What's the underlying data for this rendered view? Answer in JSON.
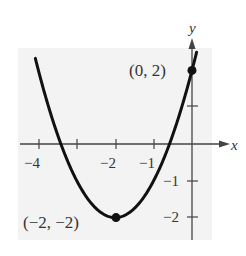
{
  "chart_data": {
    "type": "line",
    "title": "",
    "xlabel": "x",
    "ylabel": "y",
    "function": "y = (x + 2)^2 - 2",
    "xlim": [
      -4.5,
      0.5
    ],
    "ylim": [
      -2.6,
      2.6
    ],
    "x_ticks": [
      -4,
      -3,
      -2,
      -1,
      0
    ],
    "x_tick_labels": [
      "-4",
      "",
      "-2",
      "-1",
      ""
    ],
    "y_ticks": [
      -2,
      -1,
      1,
      2
    ],
    "y_tick_labels": [
      "-2",
      "-1",
      "",
      ""
    ],
    "grid": false,
    "legend": null,
    "series": [
      {
        "name": "parabola",
        "x": [
          -4.1,
          -4,
          -3.5,
          -3,
          -2.5,
          -2,
          -1.5,
          -1,
          -0.5,
          0,
          0.1
        ],
        "y": [
          2.41,
          2,
          0.25,
          -1,
          -1.75,
          -2,
          -1.75,
          -1,
          0.25,
          2,
          2.41
        ]
      }
    ],
    "points": [
      {
        "x": -2,
        "y": -2,
        "label": "(−2, −2)"
      },
      {
        "x": 0,
        "y": 2,
        "label": "(0, 2)"
      }
    ]
  },
  "labels": {
    "x_axis": "x",
    "y_axis": "y",
    "tick_x_neg4": "−4",
    "tick_x_neg2": "−2",
    "tick_x_neg1": "−1",
    "tick_y_neg1": "−1",
    "tick_y_neg2": "−2",
    "point_vertex": "(−2, −2)",
    "point_intercept": "(0, 2)"
  },
  "colors": {
    "background": "#f3f3f3",
    "curve": "#111111",
    "axis": "#444444"
  }
}
